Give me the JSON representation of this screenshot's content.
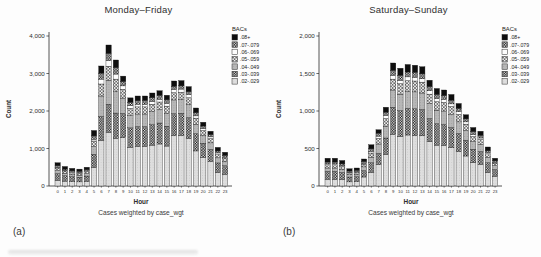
{
  "page": {
    "background": "#fdfdfd"
  },
  "chart_data": [
    {
      "type": "bar",
      "stacked": true,
      "title": "Monday–Friday",
      "panel_label": "(a)",
      "xlabel": "Hour",
      "ylabel": "Count",
      "caption": "Cases weighted by case_wgt",
      "legend_title": "BACs",
      "legend_position": "right",
      "grid": false,
      "ylim": [
        0,
        4000
      ],
      "ytick_values": [
        0,
        1000,
        2000,
        3000,
        4000
      ],
      "ytick_labels": [
        "0",
        "1,000",
        "2,000",
        "3,000",
        "4,000"
      ],
      "categories": [
        "0",
        "1",
        "2",
        "3",
        "4",
        "5",
        "6",
        "7",
        "8",
        "9",
        "10",
        "11",
        "12",
        "13",
        "14",
        "15",
        "16",
        "17",
        "18",
        "19",
        "20",
        "21",
        "22",
        "23"
      ],
      "series": [
        {
          "name": ".08+",
          "pattern": "solid-black",
          "color": "#0e0e0e",
          "values": [
            80,
            70,
            65,
            60,
            65,
            145,
            190,
            225,
            205,
            145,
            115,
            125,
            120,
            125,
            125,
            120,
            140,
            140,
            135,
            125,
            100,
            90,
            95,
            85
          ]
        },
        {
          "name": ".07-.079",
          "pattern": "dark-checker",
          "color": "#1c1c1c",
          "values": [
            40,
            35,
            30,
            30,
            35,
            90,
            160,
            190,
            170,
            115,
            95,
            95,
            100,
            100,
            100,
            95,
            85,
            85,
            80,
            85,
            70,
            60,
            50,
            45
          ]
        },
        {
          "name": ".06-.069",
          "pattern": "white",
          "color": "#fdfdfd",
          "values": [
            20,
            15,
            15,
            15,
            15,
            45,
            130,
            150,
            135,
            90,
            70,
            70,
            70,
            75,
            75,
            75,
            85,
            85,
            80,
            60,
            50,
            45,
            30,
            25
          ]
        },
        {
          "name": ".05-.059",
          "pattern": "open-diamond",
          "color": "#eeeeee",
          "values": [
            75,
            60,
            55,
            55,
            60,
            150,
            320,
            375,
            335,
            235,
            190,
            190,
            190,
            200,
            205,
            195,
            195,
            195,
            185,
            165,
            135,
            115,
            105,
            90
          ]
        },
        {
          "name": ".04-.049",
          "pattern": "gray-dot",
          "color": "#b7b7b7",
          "values": [
            75,
            65,
            55,
            55,
            60,
            205,
            545,
            640,
            570,
            410,
            330,
            335,
            335,
            345,
            355,
            340,
            365,
            365,
            345,
            250,
            205,
            175,
            135,
            115
          ]
        },
        {
          "name": ".03-.039",
          "pattern": "dark-checker",
          "color": "#2a2a2a",
          "values": [
            175,
            145,
            130,
            125,
            140,
            355,
            640,
            750,
            670,
            645,
            515,
            530,
            525,
            545,
            560,
            530,
            585,
            590,
            555,
            460,
            375,
            320,
            255,
            225
          ]
        },
        {
          "name": ".02-.029",
          "pattern": "light-dot",
          "color": "#dedede",
          "values": [
            155,
            130,
            120,
            110,
            125,
            490,
            1215,
            1430,
            1275,
            1290,
            1035,
            1055,
            1060,
            1090,
            1120,
            1065,
            1345,
            1350,
            1270,
            935,
            765,
            655,
            360,
            315
          ]
        }
      ]
    },
    {
      "type": "bar",
      "stacked": true,
      "title": "Saturday–Sunday",
      "panel_label": "(b)",
      "xlabel": "Hour",
      "ylabel": "Count",
      "caption": "Cases weighted by case_wgt",
      "legend_title": "BACs",
      "legend_position": "right",
      "grid": false,
      "ylim": [
        0,
        2000
      ],
      "ytick_values": [
        0,
        500,
        1000,
        1500,
        2000
      ],
      "ytick_labels": [
        "0",
        "500",
        "1,000",
        "1,500",
        "2,000"
      ],
      "categories": [
        "0",
        "1",
        "2",
        "3",
        "4",
        "5",
        "6",
        "7",
        "8",
        "9",
        "10",
        "11",
        "12",
        "13",
        "14",
        "15",
        "16",
        "17",
        "18",
        "19",
        "20",
        "21",
        "22",
        "23"
      ],
      "series": [
        {
          "name": ".08+",
          "pattern": "solid-black",
          "color": "#0e0e0e",
          "values": [
            50,
            50,
            45,
            30,
            30,
            35,
            55,
            45,
            65,
            100,
            95,
            100,
            95,
            95,
            85,
            80,
            75,
            75,
            65,
            55,
            55,
            55,
            50,
            35
          ]
        },
        {
          "name": ".07-.079",
          "pattern": "dark-checker",
          "color": "#1c1c1c",
          "values": [
            25,
            25,
            25,
            15,
            20,
            25,
            35,
            40,
            45,
            65,
            65,
            65,
            65,
            65,
            55,
            55,
            50,
            50,
            45,
            40,
            40,
            35,
            25,
            20
          ]
        },
        {
          "name": ".06-.069",
          "pattern": "white",
          "color": "#fdfdfd",
          "values": [
            10,
            10,
            10,
            10,
            5,
            10,
            20,
            30,
            40,
            50,
            45,
            50,
            50,
            45,
            45,
            40,
            40,
            35,
            35,
            30,
            25,
            20,
            15,
            10
          ]
        },
        {
          "name": ".05-.059",
          "pattern": "open-diamond",
          "color": "#eeeeee",
          "values": [
            45,
            45,
            40,
            25,
            30,
            35,
            55,
            75,
            105,
            145,
            140,
            145,
            145,
            145,
            125,
            115,
            115,
            110,
            100,
            85,
            70,
            65,
            50,
            35
          ]
        },
        {
          "name": ".04-.049",
          "pattern": "gray-dot",
          "color": "#b7b7b7",
          "values": [
            45,
            45,
            40,
            30,
            30,
            50,
            75,
            125,
            155,
            230,
            220,
            225,
            225,
            220,
            200,
            180,
            180,
            170,
            155,
            130,
            100,
            95,
            70,
            50
          ]
        },
        {
          "name": ".03-.039",
          "pattern": "dark-checker",
          "color": "#2a2a2a",
          "values": [
            105,
            105,
            95,
            65,
            65,
            85,
            130,
            150,
            220,
            360,
            345,
            355,
            355,
            350,
            310,
            285,
            280,
            270,
            240,
            210,
            180,
            170,
            130,
            90
          ]
        },
        {
          "name": ".02-.029",
          "pattern": "light-dot",
          "color": "#dedede",
          "values": [
            90,
            90,
            85,
            55,
            60,
            120,
            180,
            285,
            420,
            690,
            660,
            680,
            675,
            670,
            590,
            545,
            540,
            510,
            460,
            400,
            310,
            290,
            180,
            130
          ]
        }
      ]
    }
  ]
}
